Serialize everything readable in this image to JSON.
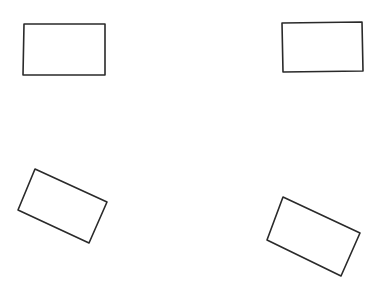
{
  "canvas": {
    "width": 382,
    "height": 285,
    "background": "#ffffff",
    "stroke": "#2a2a2a"
  },
  "shapes": [
    {
      "id": "rect-top-left",
      "type": "rectangle",
      "rotation": "upright",
      "points": "24,24 105,24 105,75 23,75"
    },
    {
      "id": "rect-top-right",
      "type": "rectangle",
      "rotation": "upright",
      "points": "282,23 362,22 363,71 283,72"
    },
    {
      "id": "rect-bottom-left",
      "type": "rectangle",
      "rotation": "tilted",
      "points": "35,169 107,202 89,243 18,210"
    },
    {
      "id": "rect-bottom-right",
      "type": "rectangle",
      "rotation": "tilted",
      "points": "283,197 360,233 341,276 267,240"
    }
  ]
}
